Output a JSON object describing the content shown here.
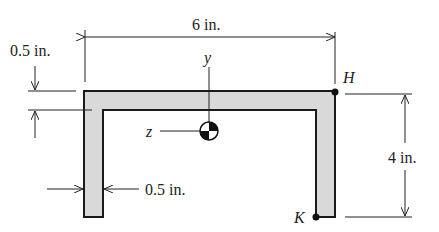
{
  "figure": {
    "type": "channel cross-section",
    "section_fill": "#d9d9d9",
    "outline_color": "#1a1a1a",
    "dimensions": {
      "width": "6 in.",
      "height": "4 in.",
      "flange_thickness": "0.5 in.",
      "web_thickness": "0.5 in."
    },
    "axes": {
      "y": "y",
      "z": "z"
    },
    "points": {
      "H": "H",
      "K": "K"
    }
  }
}
